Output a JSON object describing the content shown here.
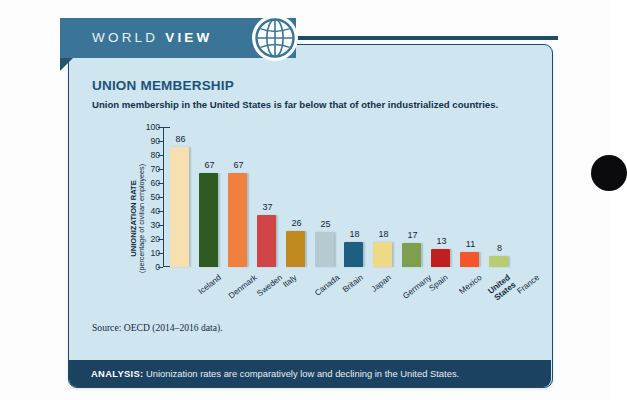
{
  "banner": {
    "word_light": "WORLD",
    "word_bold": "VIEW",
    "icon": "globe-icon"
  },
  "card": {
    "title": "UNION MEMBERSHIP",
    "subtitle": "Union membership in the United States is far below that of other industrialized countries.",
    "source": "Source: OECD (2014–2016 data)."
  },
  "analysis": {
    "lead": "ANALYSIS:",
    "text": " Unionization rates are comparatively low and declining in the United States."
  },
  "chart_data": {
    "type": "bar",
    "title": "UNION MEMBERSHIP",
    "subtitle": "Union membership in the United States is far below that of other industrialized countries.",
    "xlabel": "",
    "ylabel": "UNIONIZATION RATE",
    "ylabel_sub": "(percentage of civilian employees)",
    "ylim": [
      0,
      100
    ],
    "yticks": [
      100,
      90,
      80,
      70,
      60,
      50,
      40,
      30,
      20,
      10,
      0
    ],
    "grid": false,
    "legend": "none",
    "categories": [
      "Iceland",
      "Denmark",
      "Sweden",
      "Italy",
      "Canada",
      "Britain",
      "Japan",
      "Germany",
      "Spain",
      "Mexico",
      "United States",
      "France"
    ],
    "values": [
      86,
      67,
      67,
      37,
      26,
      25,
      18,
      18,
      17,
      13,
      11,
      8
    ],
    "colors": [
      "#f7dfaf",
      "#2f5a22",
      "#f0803f",
      "#cf4444",
      "#c08a20",
      "#b5cbd1",
      "#1d5f7e",
      "#eeda84",
      "#7f9f4e",
      "#c01f1f",
      "#f4552a",
      "#b9cc72"
    ],
    "highlight_category": "United States",
    "source": "Source: OECD (2014–2016 data)."
  },
  "theme": {
    "card_bg": "#cfe6f0",
    "card_border": "#1d4e66",
    "ribbon": "#3a7598",
    "analysis_bar": "#1b4260",
    "title_color": "#1c5378"
  }
}
